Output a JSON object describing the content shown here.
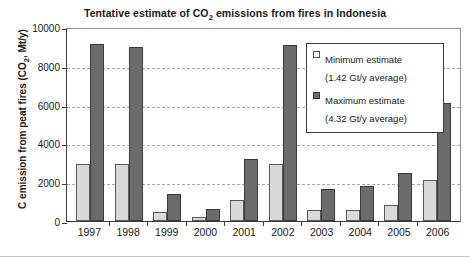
{
  "chart_data": {
    "type": "bar",
    "title": "Tentative estimate of CO2 emissions from fires in Indonesia",
    "title_prefix": "Tentative estimate of CO",
    "title_sub": "2",
    "title_suffix": " emissions from fires in Indonesia",
    "xlabel": "",
    "ylabel": "C emission from peat fires (CO2, Mt/y)",
    "ylabel_prefix": "C emission from peat fires (CO",
    "ylabel_sub": "2",
    "ylabel_suffix": ", Mt/y)",
    "categories": [
      "1997",
      "1998",
      "1999",
      "2000",
      "2001",
      "2002",
      "2003",
      "2004",
      "2005",
      "2006"
    ],
    "series": [
      {
        "name": "Minimum estimate",
        "sublabel": "(1.42 Gt/y average)",
        "color": "#d9d9d9",
        "values": [
          2950,
          2950,
          450,
          230,
          1100,
          2950,
          550,
          550,
          850,
          2100
        ]
      },
      {
        "name": "Maximum estimate",
        "sublabel": "(4.32 Gt/y average)",
        "color": "#6b6b6b",
        "values": [
          9100,
          8950,
          1400,
          600,
          3200,
          9050,
          1650,
          1800,
          2450,
          6100
        ]
      }
    ],
    "ylim": [
      0,
      10000
    ],
    "yticks": [
      0,
      2000,
      4000,
      6000,
      8000,
      10000
    ],
    "ytick_labels": [
      "0",
      "2000",
      "4000",
      "6000",
      "8000",
      "10000"
    ],
    "grid": true,
    "legend_position": "top-right"
  }
}
